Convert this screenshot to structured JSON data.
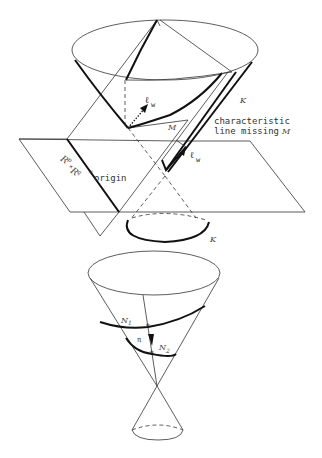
{
  "figure": {
    "upper_diagram": {
      "labels": {
        "cone_K_upper": "K",
        "cone_K_lower": "K",
        "manifold": "M",
        "vector_top": "ℓ",
        "vector_top_sub": "w",
        "vector_char": "ℓ",
        "vector_char_sub": "w",
        "char_line_1": "characteristic",
        "char_line_2": "line missing",
        "char_line_M": "M",
        "space": "R",
        "space_p": "p",
        "space_times": "×",
        "space_q": "q",
        "origin": "origin"
      }
    },
    "lower_diagram": {
      "labels": {
        "N1": "N",
        "N1_sub": "1",
        "N2": "N",
        "N2_sub": "2",
        "projection": "π"
      }
    }
  }
}
